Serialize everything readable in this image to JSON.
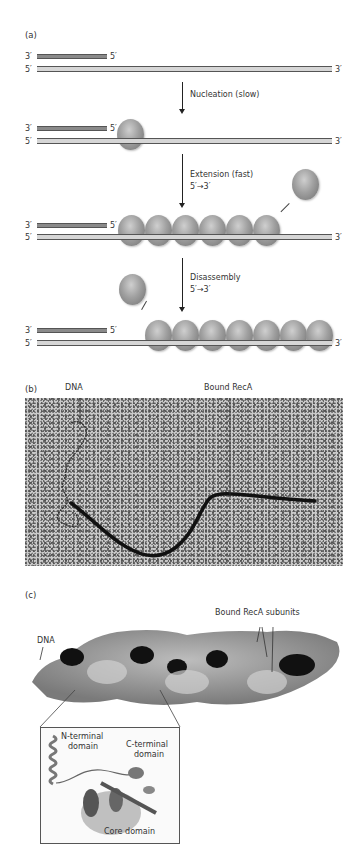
{
  "panel_a": {
    "label": "(a)",
    "rows": [
      {
        "top_left": "3′",
        "top_right": "5′",
        "bottom_left": "5′",
        "bottom_right": "3′",
        "bound_subunits": 0
      },
      {
        "top_left": "3′",
        "top_right": "5′",
        "bottom_left": "5′",
        "bottom_right": "3′",
        "bound_subunits": 1
      },
      {
        "top_left": "3′",
        "top_right": "5′",
        "bottom_left": "5′",
        "bottom_right": "3′",
        "bound_subunits": 6
      },
      {
        "top_left": "3′",
        "top_right": "5′",
        "bottom_left": "5′",
        "bottom_right": "3′",
        "bound_subunits": 7
      }
    ],
    "steps": [
      {
        "line1": "Nucleation (slow)",
        "line2": ""
      },
      {
        "line1": "Extension (fast)",
        "line2": "5′→3′"
      },
      {
        "line1": "Disassembly",
        "line2": "5′→3′"
      }
    ]
  },
  "panel_b": {
    "label": "(b)",
    "callouts": [
      "DNA",
      "Bound RecA"
    ]
  },
  "panel_c": {
    "label": "(c)",
    "callouts": [
      "DNA",
      "Bound RecA subunits"
    ],
    "inset_labels": {
      "n_terminal": [
        "N-terminal",
        "domain"
      ],
      "c_terminal": [
        "C-terminal",
        "domain"
      ],
      "core": "Core domain"
    }
  },
  "colors": {
    "dark_strand": "#8a8a8a",
    "light_strand": "#d6d6d6",
    "protein_subunit": "#a0a0a0",
    "em_background": "#c9c9c9"
  }
}
